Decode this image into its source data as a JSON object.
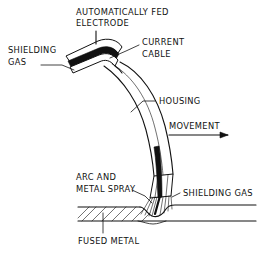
{
  "figure": {
    "background_color": "#ffffff",
    "line_color": "#111111"
  },
  "labels": {
    "electrode": {
      "line1": "AUTOMATICALLY FED",
      "line2": "ELECTRODE"
    },
    "shielding_gas_top": {
      "line1": "SHIELDING",
      "line2": "GAS"
    },
    "current_cable": {
      "line1": "CURRENT",
      "line2": "CABLE"
    },
    "housing": {
      "line1": "HOUSING"
    },
    "movement": {
      "line1": "MOVEMENT"
    },
    "arc_and_metal_spray": {
      "line1": "ARC AND",
      "line2": "METAL SPRAY"
    },
    "shielding_gas_right": {
      "line1": "SHIELDING GAS"
    },
    "fused_metal": {
      "line1": "FUSED METAL"
    }
  },
  "annotations": {
    "movement_arrow_direction": "right"
  }
}
